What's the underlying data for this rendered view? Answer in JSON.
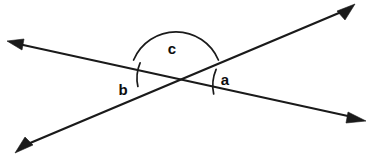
{
  "figure": {
    "width": 374,
    "height": 160,
    "background_color": "#ffffff",
    "line_color": "#1a1a1a",
    "label_color": "#0d0d0d"
  },
  "intersection": {
    "label": "intersection point",
    "x": 176,
    "y": 78
  },
  "lines": [
    {
      "name": "line-upper-left-to-lower-right",
      "description": "shallow line descending from upper left to lower right",
      "x1": 10,
      "y1": 42,
      "x2": 361,
      "y2": 119,
      "double_headed": true
    },
    {
      "name": "line-lower-left-to-upper-right",
      "description": "line ascending from lower left to upper right",
      "x1": 19,
      "y1": 148,
      "x2": 350,
      "y2": 8,
      "double_headed": true
    }
  ],
  "arrowheads": [
    {
      "name": "arrowhead-upper-left",
      "x": 10,
      "y": 42
    },
    {
      "name": "arrowhead-lower-right",
      "x": 361,
      "y": 119
    },
    {
      "name": "arrowhead-lower-left",
      "x": 19,
      "y": 148
    },
    {
      "name": "arrowhead-upper-right",
      "x": 350,
      "y": 8
    }
  ],
  "angles": [
    {
      "id": "a",
      "label": "a",
      "label_x": 225,
      "label_y": 79,
      "arc_radius": 41,
      "start_angle_deg": -12.3,
      "end_angle_deg": -157.1,
      "position": "right of intersection, between the two rays heading right",
      "arc_name": "angle-arc-a"
    },
    {
      "id": "b",
      "label": "b",
      "label_x": 123,
      "label_y": 89,
      "arc_radius": 39,
      "start_angle_deg": 22.9,
      "end_angle_deg": 167.7,
      "position": "left of intersection, between the two rays heading left",
      "arc_name": "angle-arc-b"
    },
    {
      "id": "c",
      "label": "c",
      "label_x": 172,
      "label_y": 48,
      "arc_radius": 46,
      "start_angle_deg": -157.1,
      "end_angle_deg": -22.9,
      "position": "above intersection, spanning the upper vertical angle",
      "arc_name": "angle-arc-c"
    }
  ]
}
